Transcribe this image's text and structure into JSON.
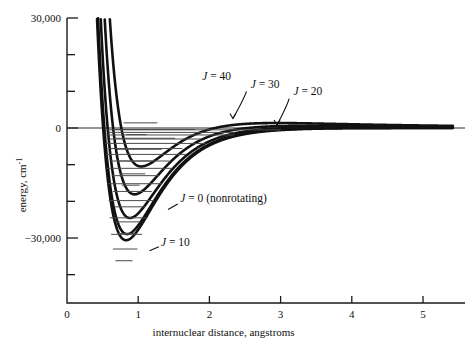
{
  "figure": {
    "name": "potential-energy-curves-diagram",
    "background": "#ffffff",
    "ink_color": "#111111",
    "level_color": "#4a4a4a"
  },
  "axes": {
    "x": {
      "title": "internuclear distance,  angstroms",
      "ticks": [
        {
          "value": 0,
          "label": "0"
        },
        {
          "value": 1,
          "label": "1"
        },
        {
          "value": 2,
          "label": "2"
        },
        {
          "value": 3,
          "label": "3"
        },
        {
          "value": 4,
          "label": "4"
        },
        {
          "value": 5,
          "label": "5"
        }
      ],
      "range": [
        0,
        5.4
      ]
    },
    "y": {
      "title_main": "energy, cm",
      "title_exponent": "-1",
      "labeled_ticks": [
        {
          "value": 30000,
          "label": "30,000"
        },
        {
          "value": 0,
          "label": "0"
        },
        {
          "value": -30000,
          "label": "−30,000"
        }
      ],
      "minor_tick_values": [
        20000,
        10000,
        -10000,
        -20000,
        -40000
      ],
      "range": [
        -43000,
        30000
      ]
    }
  },
  "annotations": [
    {
      "name": "label-j40",
      "italic": "J",
      "text": " = 40",
      "x": 1.9,
      "y": 13000,
      "leader": null
    },
    {
      "name": "label-j30",
      "italic": "J",
      "text": " = 30",
      "x": 2.58,
      "y": 11000,
      "leader": {
        "from": [
          2.52,
          10000
        ],
        "to": [
          2.33,
          2600
        ],
        "arrow": true
      }
    },
    {
      "name": "label-j20",
      "italic": "J",
      "text": " = 20",
      "x": 3.18,
      "y": 9000,
      "leader": {
        "from": [
          3.12,
          8000
        ],
        "to": [
          2.95,
          800
        ],
        "arrow": true
      }
    },
    {
      "name": "label-j0",
      "italic": "J",
      "text": " = 0  (nonrotating)",
      "x": 1.59,
      "y": -20300,
      "leader": {
        "from": [
          1.555,
          -20700
        ],
        "to": [
          1.42,
          -22200
        ],
        "arrow": false
      }
    },
    {
      "name": "label-j10",
      "italic": "J",
      "text": " = 10",
      "x": 1.32,
      "y": -32100,
      "leader": {
        "from": [
          1.29,
          -32400
        ],
        "to": [
          1.16,
          -33500
        ],
        "arrow": false
      }
    }
  ],
  "chart_data": {
    "type": "line",
    "title": "",
    "xlabel": "internuclear distance,  angstroms",
    "ylabel": "energy, cm^-1",
    "xlim": [
      0,
      5.4
    ],
    "ylim": [
      -43000,
      30000
    ],
    "grid": false,
    "legend_position": "inline-annotations",
    "series": [
      {
        "name": "J = 10",
        "J": 10,
        "minimum": {
          "r": 0.79,
          "energy": -38000
        },
        "dissociation_asymptote": 0,
        "inner_wall_r_at_30000": 0.515,
        "vibrational_levels": [
          {
            "energy": -36200,
            "r_left": 0.68,
            "r_right": 0.92
          },
          {
            "energy": -33000,
            "r_left": 0.645,
            "r_right": 0.99
          },
          {
            "energy": -29000,
            "r_left": 0.62,
            "r_right": 1.055
          },
          {
            "energy": -24500,
            "r_left": 0.6,
            "r_right": 1.13
          },
          {
            "energy": -19800,
            "r_left": 0.585,
            "r_right": 1.22
          },
          {
            "energy": -15200,
            "r_left": 0.57,
            "r_right": 1.33
          },
          {
            "energy": -11000,
            "r_left": 0.558,
            "r_right": 1.47
          },
          {
            "energy": -7200,
            "r_left": 0.548,
            "r_right": 1.67
          },
          {
            "energy": -4200,
            "r_left": 0.54,
            "r_right": 1.95
          },
          {
            "energy": -1900,
            "r_left": 0.533,
            "r_right": 2.35
          },
          {
            "energy": -500,
            "r_left": 0.528,
            "r_right": 3.0
          }
        ]
      },
      {
        "name": "J = 0 (nonrotating)",
        "J": 0,
        "minimum": {
          "r": 0.83,
          "energy": -30600
        },
        "dissociation_asymptote": 0,
        "inner_wall_r_at_30000": 0.56,
        "vibrational_levels": [
          {
            "energy": -28800,
            "r_left": 0.72,
            "r_right": 0.96
          },
          {
            "energy": -25600,
            "r_left": 0.69,
            "r_right": 1.03
          },
          {
            "energy": -21500,
            "r_left": 0.665,
            "r_right": 1.1
          },
          {
            "energy": -17300,
            "r_left": 0.645,
            "r_right": 1.19
          },
          {
            "energy": -13000,
            "r_left": 0.63,
            "r_right": 1.3
          },
          {
            "energy": -9000,
            "r_left": 0.615,
            "r_right": 1.44
          },
          {
            "energy": -5600,
            "r_left": 0.6,
            "r_right": 1.62
          },
          {
            "energy": -3000,
            "r_left": 0.592,
            "r_right": 1.9
          },
          {
            "energy": -1200,
            "r_left": 0.585,
            "r_right": 2.35
          }
        ]
      },
      {
        "name": "J = 20",
        "J": 20,
        "minimum": {
          "r": 0.88,
          "energy": -17200
        },
        "barrier_maximum": {
          "r": 2.35,
          "energy": 700
        },
        "dissociation_asymptote": 0,
        "inner_wall_r_at_30000": 0.6,
        "vibrational_levels": [
          {
            "energy": -15600,
            "r_left": 0.77,
            "r_right": 1.02
          },
          {
            "energy": -12500,
            "r_left": 0.74,
            "r_right": 1.1
          },
          {
            "energy": -9000,
            "r_left": 0.715,
            "r_right": 1.2
          },
          {
            "energy": -5800,
            "r_left": 0.7,
            "r_right": 1.33
          },
          {
            "energy": -2800,
            "r_left": 0.685,
            "r_right": 1.52
          },
          {
            "energy": -400,
            "r_left": 0.672,
            "r_right": 1.8
          }
        ]
      },
      {
        "name": "J = 30",
        "J": 30,
        "minimum": {
          "r": 0.95,
          "energy": -3500
        },
        "barrier_maximum": {
          "r": 2.1,
          "energy": 3200
        },
        "dissociation_asymptote": 0,
        "inner_wall_r_at_30000": 0.655,
        "vibrational_levels": [
          {
            "energy": -1800,
            "r_left": 0.83,
            "r_right": 1.12
          },
          {
            "energy": 1400,
            "r_left": 0.795,
            "r_right": 1.27
          }
        ]
      },
      {
        "name": "J = 40",
        "J": 40,
        "minimum": null,
        "barrier_maximum": {
          "r": 1.95,
          "energy": 10200
        },
        "shelf_energy": 10200,
        "dissociation_asymptote": 0,
        "inner_wall_r_at_30000": 0.9,
        "vibrational_levels": []
      }
    ]
  }
}
